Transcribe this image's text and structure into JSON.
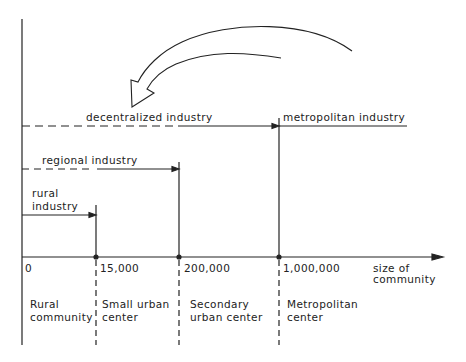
{
  "diagram": {
    "industries": {
      "decentralized": "decentralized industry",
      "metropolitan": "metropolitan industry",
      "regional": "regional industry",
      "rural_line1": "rural",
      "rural_line2": "industry"
    },
    "axis": {
      "ticks": [
        "0",
        "15,000",
        "200,000",
        "1,000,000"
      ],
      "label_line1": "size of",
      "label_line2": "community"
    },
    "zones": [
      {
        "line1": "Rural",
        "line2": "community"
      },
      {
        "line1": "Small urban",
        "line2": "center"
      },
      {
        "line1": "Secondary",
        "line2": "urban center"
      },
      {
        "line1": "Metropolitan",
        "line2": "center"
      }
    ],
    "colors": {
      "ink": "#222222",
      "background": "#ffffff"
    }
  }
}
